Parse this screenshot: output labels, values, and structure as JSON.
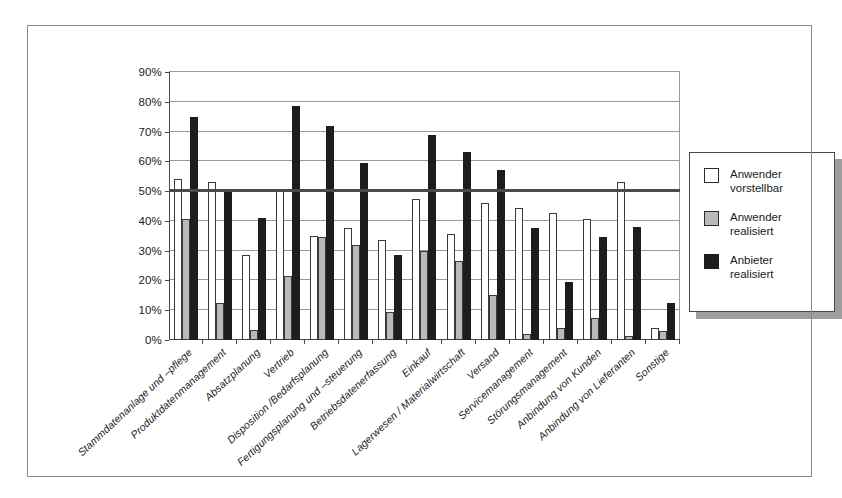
{
  "chart_data": {
    "type": "bar",
    "title": "",
    "subtitle": "",
    "xlabel": "",
    "ylabel": "",
    "ylim": [
      0,
      90
    ],
    "ytick_labels": [
      "0%",
      "10%",
      "20%",
      "30%",
      "40%",
      "50%",
      "60%",
      "70%",
      "80%",
      "90%"
    ],
    "ytick_values": [
      0,
      10,
      20,
      30,
      40,
      50,
      60,
      70,
      80,
      90
    ],
    "grid": true,
    "grid_axis": "y",
    "legend_position": "right",
    "reference_line": {
      "value": 50,
      "label": ""
    },
    "categories": [
      "Stammdatenanlage und –pflege",
      "Produktdatenmanagement",
      "Absatzplanung",
      "Vertrieb",
      "Disposition /Bedarfsplanung",
      "Fertigungsplanung und –steuerung",
      "Betriebsdatenerfassung",
      "Einkauf",
      "Lagerwesen / Materialwirtschaft",
      "Versand",
      "Servicemanagement",
      "Störungsmanagement",
      "Anbindung von Kunden",
      "Anbindung von Lieferanten",
      "Sonstige"
    ],
    "series": [
      {
        "name": "Anwender vorstellbar",
        "color": "#ffffff",
        "values": [
          54,
          53,
          28.5,
          50,
          35,
          37.5,
          33.5,
          47.5,
          35.5,
          46,
          44.5,
          42.5,
          40.5,
          53,
          4
        ]
      },
      {
        "name": "Anwender realisiert",
        "color": "#b9b9b9",
        "values": [
          40.5,
          12.5,
          3.5,
          21.5,
          34.5,
          32,
          9.5,
          30,
          26.5,
          15,
          2,
          4,
          7.5,
          1.5,
          3
        ]
      },
      {
        "name": "Anbieter realisiert",
        "color": "#1d1d1d",
        "values": [
          75,
          50,
          41,
          78.5,
          72,
          59.5,
          28.5,
          69,
          63,
          57,
          37.5,
          19.5,
          34.5,
          38,
          12.5
        ]
      }
    ]
  },
  "legend": {
    "entries": [
      {
        "line1": "Anwender",
        "line2": "vorstellbar",
        "swatch": "white-square-icon"
      },
      {
        "line1": "Anwender",
        "line2": "realisiert",
        "swatch": "gray-square-icon"
      },
      {
        "line1": "Anbieter",
        "line2": "realisiert",
        "swatch": "black-square-icon"
      }
    ]
  }
}
